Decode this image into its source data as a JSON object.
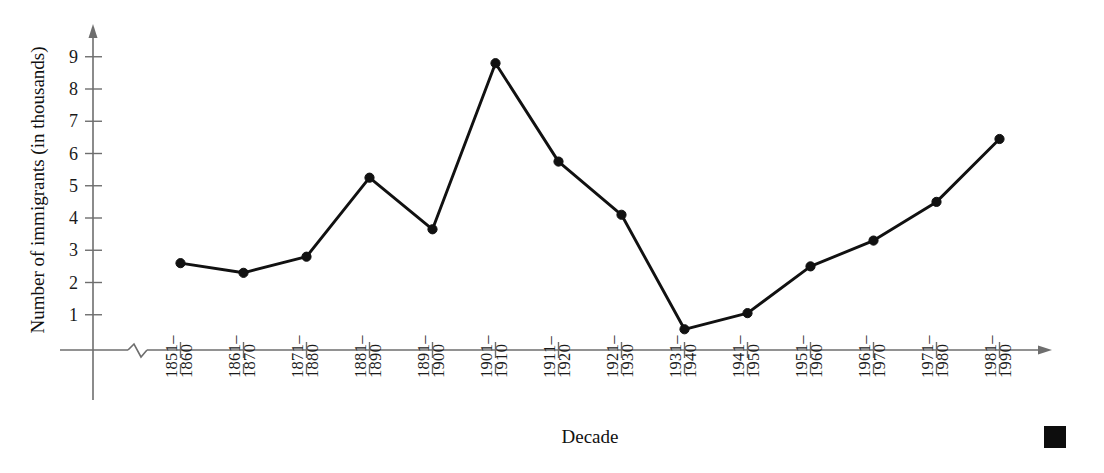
{
  "chart_data": {
    "type": "line",
    "title": "",
    "subtitle": "",
    "xlabel": "Decade",
    "ylabel": "Number of immigrants (in thousands)",
    "categories": [
      "1851–\n1860",
      "1861–\n1870",
      "1871–\n1880",
      "1881–\n1890",
      "1891–\n1900",
      "1901–\n1910",
      "1911–\n1920",
      "1921–\n1930",
      "1931–\n1940",
      "1941–\n1950",
      "1951–\n1960",
      "1961–\n1970",
      "1971–\n1980",
      "1981–\n1990"
    ],
    "category_lines": [
      [
        "1851–",
        "1860"
      ],
      [
        "1861–",
        "1870"
      ],
      [
        "1871–",
        "1880"
      ],
      [
        "1881–",
        "1890"
      ],
      [
        "1891–",
        "1900"
      ],
      [
        "1901–",
        "1910"
      ],
      [
        "1911–",
        "1920"
      ],
      [
        "1921–",
        "1930"
      ],
      [
        "1931–",
        "1940"
      ],
      [
        "1941–",
        "1950"
      ],
      [
        "1951–",
        "1960"
      ],
      [
        "1961–",
        "1970"
      ],
      [
        "1971–",
        "1980"
      ],
      [
        "1981–",
        "1990"
      ]
    ],
    "values": [
      2.6,
      2.3,
      2.8,
      5.25,
      3.65,
      8.8,
      5.75,
      4.1,
      0.55,
      1.05,
      2.5,
      3.3,
      4.5,
      6.45
    ],
    "ytick_labels": [
      "1",
      "2",
      "3",
      "4",
      "5",
      "6",
      "7",
      "8",
      "9"
    ],
    "ytick_values": [
      1,
      2,
      3,
      4,
      5,
      6,
      7,
      8,
      9
    ],
    "ylim": [
      0,
      9.6
    ],
    "grid": false,
    "legend": "none",
    "axis_break": true,
    "marker": "filled-circle",
    "line_color": "#111111",
    "axis_color": "#6e6e6e"
  },
  "decoration": {
    "corner_marker": "black-square"
  }
}
